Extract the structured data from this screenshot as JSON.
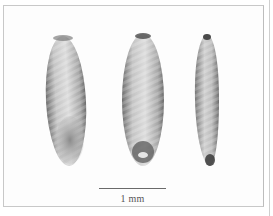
{
  "figure": {
    "specimens": [
      {
        "id": "seed-1",
        "view": "lateral view with embryo region"
      },
      {
        "id": "seed-2",
        "view": "ventral view with hilum"
      },
      {
        "id": "seed-3",
        "view": "side view"
      }
    ],
    "scale_bar": {
      "label": "1 mm"
    },
    "colors": {
      "background": "#ffffff",
      "seed_fill": "#c9c9c9",
      "seed_shadow": "#5a5a5a"
    }
  }
}
